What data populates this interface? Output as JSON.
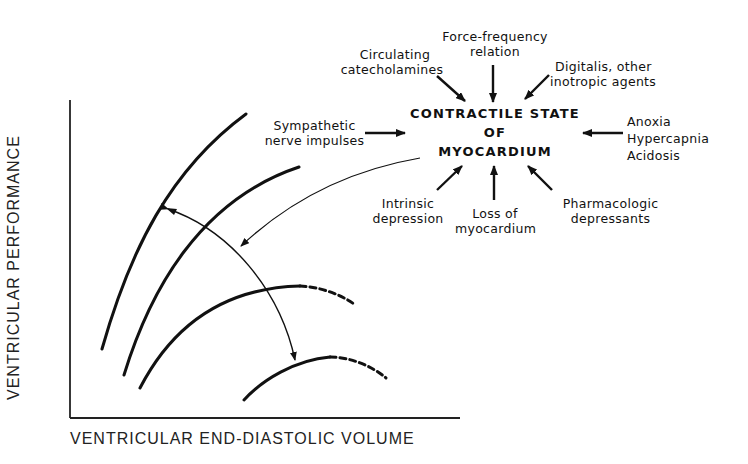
{
  "center": {
    "line1": "CONTRACTILE STATE",
    "line2": "OF",
    "line3": "MYOCARDIUM"
  },
  "influences": {
    "force_frequency": [
      "Force-frequency",
      "relation"
    ],
    "catecholamines": [
      "Circulating",
      "catecholamines"
    ],
    "digitalis": [
      "Digitalis, other",
      "inotropic agents"
    ],
    "sympathetic": [
      "Sympathetic",
      "nerve impulses"
    ],
    "anoxia": [
      "Anoxia",
      "Hypercapnia",
      "Acidosis"
    ],
    "intrinsic": [
      "Intrinsic",
      "depression"
    ],
    "loss": [
      "Loss of",
      "myocardium"
    ],
    "pharmacologic": [
      "Pharmacologic",
      "depressants"
    ]
  },
  "axes": {
    "y_label": "VENTRICULAR PERFORMANCE",
    "x_label": "VENTRICULAR END-DIASTOLIC VOLUME"
  },
  "curves": [
    {
      "name": "curve-1",
      "style": "solid"
    },
    {
      "name": "curve-2",
      "style": "solid"
    },
    {
      "name": "curve-3",
      "style": "solid-then-dashed"
    },
    {
      "name": "curve-4",
      "style": "solid-then-dashed"
    }
  ],
  "colors": {
    "ink": "#111111",
    "background": "#ffffff"
  }
}
